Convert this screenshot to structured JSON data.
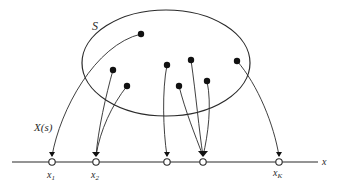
{
  "diagram": {
    "set_label": "S",
    "mapping_label": "X(s)",
    "axis_label": "x",
    "point_labels": [
      {
        "main": "x",
        "sub": "1"
      },
      {
        "main": "x",
        "sub": "2"
      },
      {
        "main": "x",
        "sub": "K"
      }
    ],
    "colors": {
      "stroke": "#2a2a2a",
      "dot": "#111111",
      "background": "#ffffff"
    }
  }
}
